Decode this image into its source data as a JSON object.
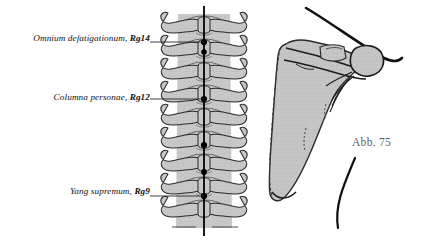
{
  "figure": {
    "caption": "Abb. 75",
    "background_color": "#ffffff",
    "bone_fill_color": "#c9c9c9",
    "outline_color": "#1a1a1a",
    "meridian_color": "#000000",
    "caption_color": "#5c5c5c",
    "labels": [
      {
        "id": "rg14",
        "text": "Omnium defatigationum,",
        "point_code": "Rg14",
        "leader_to_x": 204,
        "leader_to_y": 42
      },
      {
        "id": "rg12",
        "text": "Columna personae,",
        "point_code": "Rg12",
        "leader_to_x": 204,
        "leader_to_y": 99
      },
      {
        "id": "rg9",
        "text": "Yang supremum,",
        "point_code": "Rg9",
        "leader_to_x": 204,
        "leader_to_y": 196
      }
    ],
    "meridian_points_y": [
      42,
      52,
      99,
      145,
      172,
      196
    ],
    "anatomy": {
      "left_panel": "vertebral-column-posterior-view",
      "right_panel": "scapula-posterior-view"
    }
  }
}
